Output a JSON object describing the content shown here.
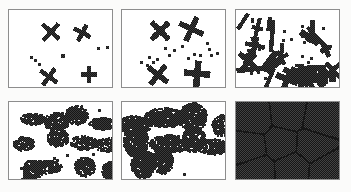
{
  "figure": {
    "panel_count": 6,
    "rows": 2,
    "columns": 3,
    "background_color": "#fbfbfa",
    "panel_fill_color": "#ffffff",
    "panel_border_color": "#8d8d8d",
    "ink_color": "#161616",
    "cell_size_px": 2
  },
  "panels": [
    {
      "id": "panel-a",
      "name": "panel-stage-1",
      "label": "",
      "stage": 1,
      "coverage_percent": 3,
      "seed": 11,
      "x": 8,
      "y": 9,
      "width": 105,
      "height": 79,
      "cluster_count": 6,
      "monomer_count": 9,
      "style": "crosses",
      "clusters": [
        {
          "cx": 42,
          "cy": 22,
          "arm": 11,
          "thickness": 4,
          "angle": 42
        },
        {
          "cx": 74,
          "cy": 23,
          "arm": 9,
          "thickness": 4,
          "angle": 28
        },
        {
          "cx": 40,
          "cy": 68,
          "arm": 10,
          "thickness": 4,
          "angle": 35
        },
        {
          "cx": 81,
          "cy": 66,
          "arm": 8,
          "thickness": 4,
          "angle": 0
        }
      ],
      "monomers": [
        {
          "cx": 90,
          "cy": 38,
          "size": 4
        },
        {
          "cx": 99,
          "cy": 37,
          "size": 4
        },
        {
          "cx": 53,
          "cy": 45,
          "size": 5
        },
        {
          "cx": 21,
          "cy": 47,
          "size": 4
        },
        {
          "cx": 25,
          "cy": 50,
          "size": 4
        },
        {
          "cx": 30,
          "cy": 54,
          "size": 4
        }
      ]
    },
    {
      "id": "panel-b",
      "name": "panel-stage-2",
      "label": "",
      "stage": 2,
      "coverage_percent": 7,
      "seed": 23,
      "x": 121,
      "y": 9,
      "width": 105,
      "height": 79,
      "cluster_count": 8,
      "monomer_count": 22,
      "style": "crosses",
      "clusters": [
        {
          "cx": 38,
          "cy": 21,
          "arm": 12,
          "thickness": 5,
          "angle": 45
        },
        {
          "cx": 70,
          "cy": 19,
          "arm": 13,
          "thickness": 5,
          "angle": 25
        },
        {
          "cx": 36,
          "cy": 66,
          "arm": 12,
          "thickness": 5,
          "angle": 38
        },
        {
          "cx": 76,
          "cy": 65,
          "arm": 13,
          "thickness": 6,
          "angle": 5
        }
      ],
      "monomers": [
        {
          "cx": 60,
          "cy": 36,
          "size": 4
        },
        {
          "cx": 52,
          "cy": 40,
          "size": 4
        },
        {
          "cx": 47,
          "cy": 45,
          "size": 4
        },
        {
          "cx": 43,
          "cy": 38,
          "size": 4
        },
        {
          "cx": 86,
          "cy": 33,
          "size": 4
        },
        {
          "cx": 88,
          "cy": 39,
          "size": 4
        },
        {
          "cx": 90,
          "cy": 45,
          "size": 4
        },
        {
          "cx": 96,
          "cy": 43,
          "size": 4
        },
        {
          "cx": 79,
          "cy": 45,
          "size": 4
        },
        {
          "cx": 72,
          "cy": 44,
          "size": 4
        },
        {
          "cx": 66,
          "cy": 48,
          "size": 4
        },
        {
          "cx": 26,
          "cy": 47,
          "size": 4
        },
        {
          "cx": 18,
          "cy": 52,
          "size": 4
        },
        {
          "cx": 24,
          "cy": 55,
          "size": 4
        },
        {
          "cx": 31,
          "cy": 52,
          "size": 4
        },
        {
          "cx": 35,
          "cy": 49,
          "size": 4
        }
      ]
    },
    {
      "id": "panel-c",
      "name": "panel-stage-3",
      "label": "",
      "stage": 3,
      "coverage_percent": 18,
      "seed": 37,
      "x": 235,
      "y": 9,
      "width": 105,
      "height": 79,
      "cluster_count": 26,
      "monomer_count": 30,
      "style": "rods-and-crosses"
    },
    {
      "id": "panel-d",
      "name": "panel-stage-4",
      "label": "",
      "stage": 4,
      "coverage_percent": 45,
      "seed": 53,
      "x": 8,
      "y": 101,
      "width": 105,
      "height": 79,
      "cluster_count": 14,
      "monomer_count": 14,
      "style": "blobs"
    },
    {
      "id": "panel-e",
      "name": "panel-stage-5",
      "label": "",
      "stage": 5,
      "coverage_percent": 72,
      "seed": 71,
      "x": 121,
      "y": 101,
      "width": 105,
      "height": 79,
      "cluster_count": 10,
      "monomer_count": 2,
      "style": "big-blobs"
    },
    {
      "id": "panel-f",
      "name": "panel-stage-6",
      "label": "",
      "stage": 6,
      "coverage_percent": 100,
      "seed": 97,
      "x": 235,
      "y": 101,
      "width": 105,
      "height": 79,
      "cluster_count": 9,
      "monomer_count": 0,
      "style": "grain-boundaries",
      "grain_seeds": [
        {
          "cx": 18,
          "cy": 16
        },
        {
          "cx": 52,
          "cy": 12
        },
        {
          "cx": 86,
          "cy": 18
        },
        {
          "cx": 14,
          "cy": 46
        },
        {
          "cx": 45,
          "cy": 42
        },
        {
          "cx": 78,
          "cy": 44
        },
        {
          "cx": 22,
          "cy": 70
        },
        {
          "cx": 56,
          "cy": 68
        },
        {
          "cx": 92,
          "cy": 70
        }
      ]
    }
  ]
}
